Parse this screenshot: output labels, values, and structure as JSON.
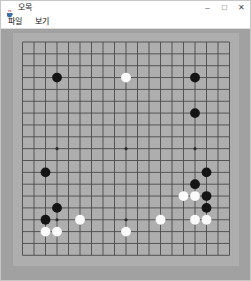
{
  "window": {
    "title": "오목",
    "controls": {
      "minimize": "–",
      "maximize": "□",
      "close": "✕"
    }
  },
  "menu": {
    "items": [
      "파일",
      "보기"
    ]
  },
  "board": {
    "size": 19,
    "colors": {
      "panel": "#a1a1a1",
      "board": "#aeaeae",
      "line": "#4b4b4b",
      "star": "#2b2b2b",
      "black_stone": "#141414",
      "white_stone": "#fafafa"
    },
    "star_points": [
      [
        3,
        3
      ],
      [
        9,
        3
      ],
      [
        15,
        3
      ],
      [
        3,
        9
      ],
      [
        9,
        9
      ],
      [
        15,
        9
      ],
      [
        3,
        15
      ],
      [
        9,
        15
      ],
      [
        15,
        15
      ]
    ],
    "stones": [
      {
        "col": 3,
        "row": 3,
        "color": "black"
      },
      {
        "col": 9,
        "row": 3,
        "color": "white"
      },
      {
        "col": 15,
        "row": 3,
        "color": "black"
      },
      {
        "col": 15,
        "row": 6,
        "color": "black"
      },
      {
        "col": 2,
        "row": 11,
        "color": "black"
      },
      {
        "col": 16,
        "row": 11,
        "color": "black"
      },
      {
        "col": 15,
        "row": 12,
        "color": "black"
      },
      {
        "col": 14,
        "row": 13,
        "color": "white"
      },
      {
        "col": 15,
        "row": 13,
        "color": "white"
      },
      {
        "col": 16,
        "row": 13,
        "color": "black"
      },
      {
        "col": 16,
        "row": 14,
        "color": "black"
      },
      {
        "col": 3,
        "row": 14,
        "color": "black"
      },
      {
        "col": 2,
        "row": 15,
        "color": "black"
      },
      {
        "col": 5,
        "row": 15,
        "color": "white"
      },
      {
        "col": 12,
        "row": 15,
        "color": "white"
      },
      {
        "col": 15,
        "row": 15,
        "color": "white"
      },
      {
        "col": 16,
        "row": 15,
        "color": "white"
      },
      {
        "col": 2,
        "row": 16,
        "color": "white"
      },
      {
        "col": 3,
        "row": 16,
        "color": "white"
      },
      {
        "col": 9,
        "row": 16,
        "color": "white"
      }
    ]
  }
}
